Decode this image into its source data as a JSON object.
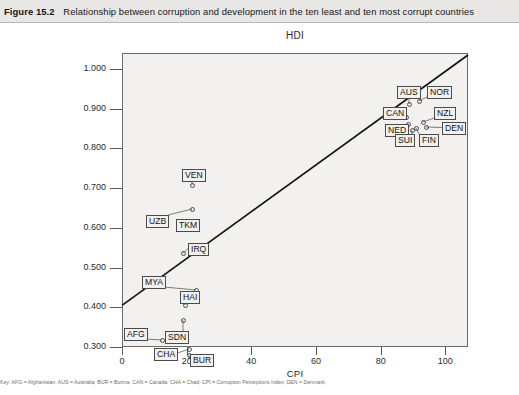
{
  "caption": {
    "figure_number": "Figure 15.2",
    "text": "Relationship between corruption and development in the ten least and ten most corrupt countries"
  },
  "footnote": {
    "text": "Key: AFG = Afghanistan; AUS = Australia; BUR = Burma; CAN = Canada; CHA = Chad; CPI = Corruption Perceptions Index; DEN = Denmark;"
  },
  "chart_data": {
    "type": "scatter",
    "title": "HDI",
    "xlabel": "CPI",
    "ylabel": "HDI",
    "xlim": [
      0,
      107
    ],
    "ylim": [
      0.3,
      1.04
    ],
    "xticks": [
      "0",
      "20",
      "40",
      "60",
      "80",
      "100"
    ],
    "xtick_values": [
      0,
      20,
      40,
      60,
      80,
      100
    ],
    "yticks": [
      "0.300",
      "0.400",
      "0.500",
      "0.600",
      "0.700",
      "0.800",
      "0.900",
      "1.000"
    ],
    "ytick_values": [
      0.3,
      0.4,
      0.5,
      0.6,
      0.7,
      0.8,
      0.9,
      1.0
    ],
    "grid": false,
    "legend": "none",
    "trendline": {
      "x0": 0,
      "y0": 0.405,
      "x1": 107,
      "y1": 1.035
    },
    "points": [
      {
        "label": "VEN",
        "x": 18,
        "y": 0.772,
        "lx": 182,
        "ly": 146,
        "px": 192,
        "py": 162
      },
      {
        "label": "UZB",
        "x": 19,
        "y": 0.695,
        "lx": 146,
        "ly": 192,
        "px": 192,
        "py": 186
      },
      {
        "label": "TKM",
        "x": 19,
        "y": 0.663,
        "lx": 176,
        "ly": 196,
        "px": 194,
        "py": 203
      },
      {
        "label": "IRQ",
        "x": 22,
        "y": 0.59,
        "lx": 188,
        "ly": 220,
        "px": 183,
        "py": 230
      },
      {
        "label": "MYA",
        "x": 19,
        "y": 0.505,
        "lx": 142,
        "ly": 253,
        "px": 196,
        "py": 267
      },
      {
        "label": "HAI",
        "x": 23,
        "y": 0.475,
        "lx": 180,
        "ly": 268,
        "px": 185,
        "py": 282
      },
      {
        "label": "SDN",
        "x": 17,
        "y": 0.415,
        "lx": 165,
        "ly": 308,
        "px": 183,
        "py": 297
      },
      {
        "label": "AFG",
        "x": 15,
        "y": 0.385,
        "lx": 124,
        "ly": 305,
        "px": 162,
        "py": 317
      },
      {
        "label": "CHA",
        "x": 19,
        "y": 0.33,
        "lx": 154,
        "ly": 325,
        "px": 189,
        "py": 326
      },
      {
        "label": "BUR",
        "x": 20,
        "y": 0.325,
        "lx": 190,
        "ly": 331,
        "px": 189,
        "py": 332
      },
      {
        "label": "AUS",
        "x": 86,
        "y": 0.965,
        "lx": 397,
        "ly": 63,
        "px": 409,
        "py": 81
      },
      {
        "label": "NOR",
        "x": 89,
        "y": 0.968,
        "lx": 427,
        "ly": 63,
        "px": 419,
        "py": 78
      },
      {
        "label": "CAN",
        "x": 84,
        "y": 0.94,
        "lx": 383,
        "ly": 84,
        "px": 406,
        "py": 94
      },
      {
        "label": "NED",
        "x": 86,
        "y": 0.925,
        "lx": 385,
        "ly": 101,
        "px": 408,
        "py": 101
      },
      {
        "label": "NZL",
        "x": 93,
        "y": 0.925,
        "lx": 434,
        "ly": 84,
        "px": 423,
        "py": 99
      },
      {
        "label": "DEN",
        "x": 94,
        "y": 0.912,
        "lx": 442,
        "ly": 99,
        "px": 426,
        "py": 104
      },
      {
        "label": "SUI",
        "x": 86,
        "y": 0.903,
        "lx": 395,
        "ly": 111,
        "px": 412,
        "py": 107
      },
      {
        "label": "FIN",
        "x": 89,
        "y": 0.908,
        "lx": 419,
        "ly": 111,
        "px": 416,
        "py": 105
      }
    ]
  }
}
